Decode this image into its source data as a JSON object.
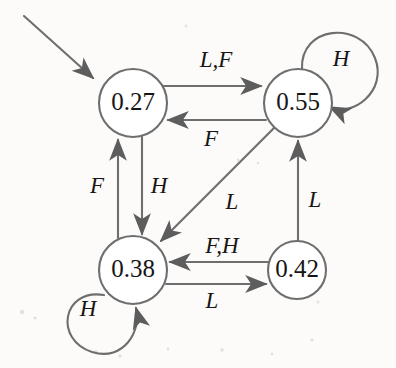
{
  "diagram": {
    "type": "state-transition-diagram",
    "title": "",
    "background_color": "#fcfbf9",
    "stroke_color": "#6e6e6e",
    "text_color": "#161616",
    "node_fill": "#ffffff",
    "start_marker": {
      "name": "start-arrow",
      "target": "0.27",
      "from_x": 24,
      "from_y": 16,
      "to_x": 96,
      "to_y": 81
    },
    "nodes": [
      {
        "id": "n1",
        "label": "0.27",
        "cx": 133,
        "cy": 103,
        "r": 34
      },
      {
        "id": "n2",
        "label": "0.55",
        "cx": 298,
        "cy": 103,
        "r": 34
      },
      {
        "id": "n3",
        "label": "0.38",
        "cx": 133,
        "cy": 270,
        "r": 34
      },
      {
        "id": "n4",
        "label": "0.42",
        "cx": 297,
        "cy": 270,
        "r": 29
      }
    ],
    "edges": [
      {
        "id": "e1",
        "from": "0.27",
        "to": "0.55",
        "label": "L,F",
        "label_x": 216,
        "label_y": 62,
        "shape": "straight-right-top"
      },
      {
        "id": "e2",
        "from": "0.55",
        "to": "0.27",
        "label": "F",
        "label_x": 211,
        "label_y": 141,
        "shape": "straight-left-bottom"
      },
      {
        "id": "e3",
        "from": "0.38",
        "to": "0.27",
        "label": "F",
        "label_x": 97,
        "label_y": 188,
        "shape": "vertical-up"
      },
      {
        "id": "e4",
        "from": "0.27",
        "to": "0.38",
        "label": "H",
        "label_x": 159,
        "label_y": 188,
        "shape": "vertical-down"
      },
      {
        "id": "e5",
        "from": "0.55",
        "to": "0.38",
        "label": "L",
        "label_x": 232,
        "label_y": 204,
        "shape": "diagonal-down-left"
      },
      {
        "id": "e6",
        "from": "0.42",
        "to": "0.55",
        "label": "L",
        "label_x": 315,
        "label_y": 202,
        "shape": "vertical-up"
      },
      {
        "id": "e7",
        "from": "0.42",
        "to": "0.38",
        "label": "F,H",
        "label_x": 222,
        "label_y": 248,
        "shape": "straight-left-top"
      },
      {
        "id": "e8",
        "from": "0.38",
        "to": "0.42",
        "label": "L",
        "label_x": 212,
        "label_y": 303,
        "shape": "straight-right-bottom"
      }
    ],
    "self_loops": [
      {
        "id": "l1",
        "node": "0.55",
        "label": "H",
        "label_x": 341,
        "label_y": 61,
        "direction": "upper-right"
      },
      {
        "id": "l2",
        "node": "0.38",
        "label": "H",
        "label_x": 88,
        "label_y": 311,
        "direction": "lower-left"
      }
    ],
    "alphabet": [
      "L",
      "F",
      "H"
    ]
  }
}
